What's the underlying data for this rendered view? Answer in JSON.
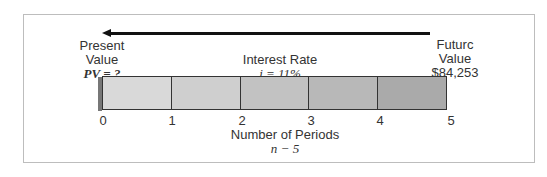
{
  "diagram": {
    "type": "timeline-present-value",
    "arrow": {
      "direction": "left",
      "from": "future",
      "to": "present"
    },
    "left_label": {
      "line1": "Present",
      "line2": "Value",
      "line3": "PV = ?"
    },
    "center_label": {
      "line1": "Interest Rate",
      "line2": "i = 11%"
    },
    "right_label": {
      "line1": "Futurc",
      "line2": "Value",
      "line3": "$84,253"
    },
    "periods": {
      "ticks": [
        "0",
        "1",
        "2",
        "3",
        "4",
        "5"
      ],
      "segment_colors": [
        "#d9d9d9",
        "#cfcfcf",
        "#c2c2c2",
        "#b8b8b8",
        "#aaaaaa"
      ]
    },
    "axis_label": {
      "line1": "Number of Periods",
      "line2": "n − 5"
    }
  }
}
